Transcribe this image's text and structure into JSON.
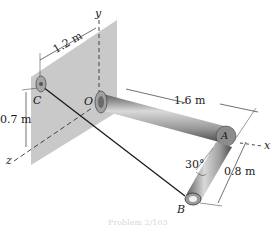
{
  "diagram": {
    "type": "3D statics structure",
    "points": {
      "O": "O",
      "A": "A",
      "B": "B",
      "C": "C"
    },
    "axes": {
      "x": "x",
      "y": "y",
      "z": "z"
    },
    "dimensions": {
      "c_to_y_axis": "1.2 m",
      "c_height": "0.7 m",
      "oa_length": "1.6 m",
      "ab_length": "0.8 m",
      "angle": "30°"
    },
    "caption": "Problem 2/103"
  },
  "colors": {
    "wall": "#c9c9c9",
    "pipe": "#8a8a8a",
    "pipe_highlight": "#d6d6d6",
    "line": "#222222"
  }
}
